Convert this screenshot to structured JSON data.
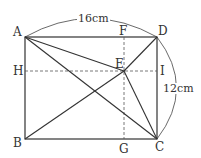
{
  "diagram": {
    "points": {
      "A": "A",
      "B": "B",
      "C": "C",
      "D": "D",
      "E": "E",
      "F": "F",
      "G": "G",
      "H": "H",
      "I": "I"
    },
    "dimensions": {
      "top": "16cm",
      "right": "12cm"
    },
    "colors": {
      "line": "#333333",
      "dashed": "#555555"
    }
  }
}
